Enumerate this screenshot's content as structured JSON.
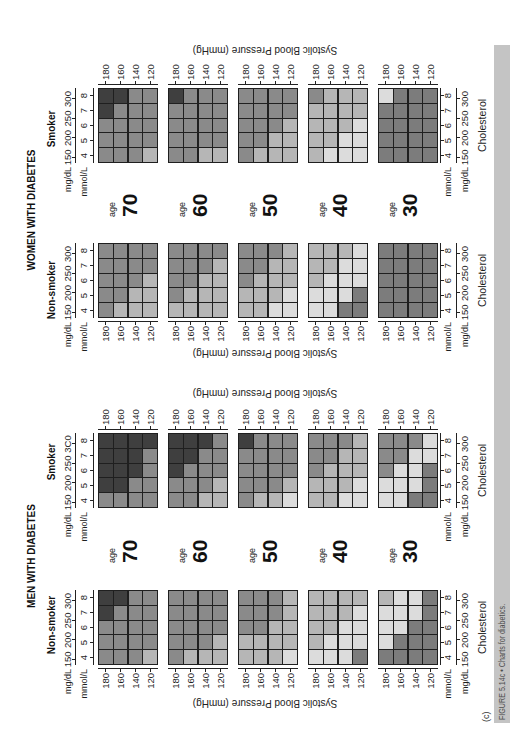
{
  "figure": {
    "panel_label": "(c)",
    "caption": "FIGURE 5.14c • Charts for diabetics.",
    "caption_bar_color": "#c4c4c4",
    "caption_text_color": "#4e4e4e"
  },
  "labels": {
    "age_word": "age",
    "mmol_unit": "mmol/L",
    "mgdl_unit": "mg/dL"
  },
  "chart_data": {
    "type": "heatmap",
    "title": "Charts for diabetics.",
    "xlabel": "Cholesterol",
    "ylabel": "Systolic Blood Pressure (mmHg)",
    "x_ticks_mmol": [
      "4",
      "5",
      "6",
      "7",
      "8"
    ],
    "x_ticks_mgdl": [
      "150",
      "200",
      "250",
      "300"
    ],
    "y_ticks": [
      "180",
      "160",
      "140",
      "120"
    ],
    "row_ages": [
      "70",
      "60",
      "50",
      "40",
      "30"
    ],
    "grid": false,
    "legend": null,
    "cell_layout": "cells[bp_row][chol_col]; bp rows 180,160,140,120; chol cols 4,5,6,7,8 mmol/L",
    "shade_key": {
      "D": "#3f3f3f",
      "M": "#8a8a8a",
      "L": "#b6b6b6",
      "V": "#dcdcdc",
      "G": "#7c7c7c"
    },
    "shade_names": {
      "D": "very dark",
      "M": "medium",
      "L": "light",
      "V": "very light",
      "G": "medium-dark"
    },
    "columns": [
      {
        "group": "MEN WITH DIABETES",
        "smoking": "Non-smoker",
        "panels": [
          {
            "age": "70",
            "cells": [
              [
                "M",
                "M",
                "M",
                "D",
                "D"
              ],
              [
                "M",
                "M",
                "M",
                "M",
                "D"
              ],
              [
                "M",
                "M",
                "M",
                "M",
                "M"
              ],
              [
                "L",
                "M",
                "M",
                "M",
                "M"
              ]
            ]
          },
          {
            "age": "60",
            "cells": [
              [
                "M",
                "M",
                "M",
                "M",
                "M"
              ],
              [
                "L",
                "M",
                "M",
                "M",
                "M"
              ],
              [
                "L",
                "M",
                "M",
                "M",
                "M"
              ],
              [
                "L",
                "L",
                "M",
                "M",
                "M"
              ]
            ]
          },
          {
            "age": "50",
            "cells": [
              [
                "L",
                "L",
                "M",
                "M",
                "M"
              ],
              [
                "L",
                "L",
                "M",
                "M",
                "M"
              ],
              [
                "L",
                "L",
                "L",
                "M",
                "M"
              ],
              [
                "V",
                "L",
                "L",
                "L",
                "L"
              ]
            ]
          },
          {
            "age": "40",
            "cells": [
              [
                "V",
                "L",
                "L",
                "L",
                "L"
              ],
              [
                "V",
                "V",
                "L",
                "L",
                "L"
              ],
              [
                "V",
                "V",
                "V",
                "L",
                "L"
              ],
              [
                "G",
                "V",
                "V",
                "V",
                "L"
              ]
            ]
          },
          {
            "age": "30",
            "cells": [
              [
                "G",
                "V",
                "V",
                "V",
                "L"
              ],
              [
                "G",
                "G",
                "V",
                "V",
                "V"
              ],
              [
                "G",
                "G",
                "G",
                "V",
                "V"
              ],
              [
                "G",
                "G",
                "G",
                "G",
                "G"
              ]
            ]
          }
        ]
      },
      {
        "group": "MEN WITH DIABETES",
        "smoking": "Smoker",
        "x_ticks_mgdl_top": [
          "150",
          "200",
          "250",
          "3C0"
        ],
        "panels": [
          {
            "age": "70",
            "cells": [
              [
                "M",
                "D",
                "D",
                "D",
                "D"
              ],
              [
                "M",
                "D",
                "D",
                "D",
                "D"
              ],
              [
                "M",
                "M",
                "D",
                "D",
                "D"
              ],
              [
                "M",
                "M",
                "M",
                "M",
                "D"
              ]
            ]
          },
          {
            "age": "60",
            "cells": [
              [
                "M",
                "M",
                "D",
                "D",
                "D"
              ],
              [
                "M",
                "M",
                "M",
                "D",
                "D"
              ],
              [
                "L",
                "M",
                "M",
                "M",
                "D"
              ],
              [
                "L",
                "L",
                "M",
                "M",
                "M"
              ]
            ]
          },
          {
            "age": "50",
            "cells": [
              [
                "M",
                "M",
                "M",
                "M",
                "D"
              ],
              [
                "L",
                "M",
                "M",
                "M",
                "M"
              ],
              [
                "L",
                "M",
                "M",
                "M",
                "M"
              ],
              [
                "V",
                "L",
                "M",
                "M",
                "M"
              ]
            ]
          },
          {
            "age": "40",
            "cells": [
              [
                "L",
                "L",
                "M",
                "M",
                "M"
              ],
              [
                "L",
                "L",
                "L",
                "M",
                "M"
              ],
              [
                "V",
                "L",
                "L",
                "L",
                "M"
              ],
              [
                "V",
                "V",
                "L",
                "L",
                "L"
              ]
            ]
          },
          {
            "age": "30",
            "cells": [
              [
                "V",
                "V",
                "M",
                "M",
                "M"
              ],
              [
                "V",
                "V",
                "V",
                "M",
                "M"
              ],
              [
                "G",
                "V",
                "V",
                "V",
                "M"
              ],
              [
                "G",
                "G",
                "G",
                "V",
                "V"
              ]
            ]
          }
        ]
      },
      {
        "group": "WOMEN WITH DIABETES",
        "smoking": "Non-smoker",
        "panels": [
          {
            "age": "70",
            "cells": [
              [
                "M",
                "M",
                "M",
                "M",
                "M"
              ],
              [
                "L",
                "M",
                "M",
                "M",
                "M"
              ],
              [
                "L",
                "L",
                "M",
                "M",
                "M"
              ],
              [
                "L",
                "L",
                "L",
                "M",
                "M"
              ]
            ]
          },
          {
            "age": "60",
            "cells": [
              [
                "L",
                "M",
                "M",
                "M",
                "M"
              ],
              [
                "L",
                "L",
                "M",
                "M",
                "M"
              ],
              [
                "L",
                "L",
                "L",
                "M",
                "M"
              ],
              [
                "L",
                "L",
                "L",
                "L",
                "M"
              ]
            ]
          },
          {
            "age": "50",
            "cells": [
              [
                "L",
                "L",
                "M",
                "M",
                "M"
              ],
              [
                "L",
                "L",
                "L",
                "M",
                "M"
              ],
              [
                "V",
                "L",
                "L",
                "L",
                "M"
              ],
              [
                "V",
                "V",
                "L",
                "L",
                "L"
              ]
            ]
          },
          {
            "age": "40",
            "cells": [
              [
                "V",
                "V",
                "L",
                "L",
                "L"
              ],
              [
                "V",
                "V",
                "V",
                "L",
                "L"
              ],
              [
                "G",
                "V",
                "V",
                "V",
                "L"
              ],
              [
                "G",
                "G",
                "V",
                "V",
                "V"
              ]
            ]
          },
          {
            "age": "30",
            "cells": [
              [
                "G",
                "G",
                "G",
                "G",
                "G"
              ],
              [
                "G",
                "G",
                "G",
                "G",
                "G"
              ],
              [
                "G",
                "G",
                "G",
                "G",
                "G"
              ],
              [
                "G",
                "G",
                "G",
                "G",
                "G"
              ]
            ]
          }
        ]
      },
      {
        "group": "WOMEN WITH DIABETES",
        "smoking": "Smoker",
        "panels": [
          {
            "age": "70",
            "cells": [
              [
                "M",
                "M",
                "M",
                "D",
                "D"
              ],
              [
                "M",
                "M",
                "M",
                "M",
                "D"
              ],
              [
                "M",
                "M",
                "M",
                "M",
                "M"
              ],
              [
                "L",
                "M",
                "M",
                "M",
                "M"
              ]
            ]
          },
          {
            "age": "60",
            "cells": [
              [
                "M",
                "M",
                "M",
                "M",
                "D"
              ],
              [
                "M",
                "M",
                "M",
                "M",
                "M"
              ],
              [
                "L",
                "M",
                "M",
                "M",
                "M"
              ],
              [
                "L",
                "M",
                "M",
                "M",
                "M"
              ]
            ]
          },
          {
            "age": "50",
            "cells": [
              [
                "M",
                "M",
                "M",
                "M",
                "M"
              ],
              [
                "L",
                "M",
                "M",
                "M",
                "M"
              ],
              [
                "L",
                "L",
                "M",
                "M",
                "M"
              ],
              [
                "L",
                "L",
                "L",
                "M",
                "M"
              ]
            ]
          },
          {
            "age": "40",
            "cells": [
              [
                "L",
                "L",
                "L",
                "L",
                "M"
              ],
              [
                "V",
                "L",
                "L",
                "L",
                "L"
              ],
              [
                "V",
                "V",
                "L",
                "L",
                "L"
              ],
              [
                "V",
                "V",
                "V",
                "L",
                "L"
              ]
            ]
          },
          {
            "age": "30",
            "cells": [
              [
                "G",
                "G",
                "G",
                "G",
                "V"
              ],
              [
                "G",
                "G",
                "G",
                "G",
                "G"
              ],
              [
                "G",
                "G",
                "G",
                "G",
                "G"
              ],
              [
                "G",
                "G",
                "G",
                "G",
                "G"
              ]
            ]
          }
        ]
      }
    ]
  }
}
